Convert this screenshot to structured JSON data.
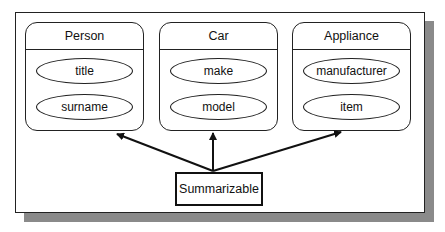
{
  "diagram": {
    "classes": [
      {
        "name": "Person",
        "attributes": [
          "title",
          "surname"
        ]
      },
      {
        "name": "Car",
        "attributes": [
          "make",
          "model"
        ]
      },
      {
        "name": "Appliance",
        "attributes": [
          "manufacturer",
          "item"
        ]
      }
    ],
    "interface": {
      "name": "Summarizable"
    },
    "edges": [
      {
        "from": "Summarizable",
        "to": "Person",
        "type": "arrow"
      },
      {
        "from": "Summarizable",
        "to": "Car",
        "type": "arrow"
      },
      {
        "from": "Summarizable",
        "to": "Appliance",
        "type": "arrow"
      }
    ],
    "colors": {
      "stroke": "#222222",
      "shadow": "#8a8a8a",
      "background": "#ffffff"
    }
  }
}
